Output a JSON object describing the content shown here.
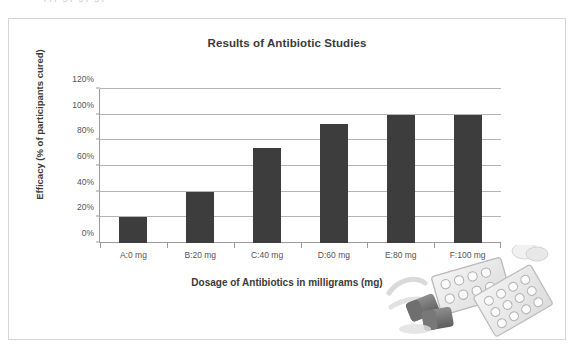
{
  "figure": {
    "top_crop_text": "ppp g p g p g p",
    "border_color": "#d6d6d6",
    "background": "#ffffff"
  },
  "chart_data": {
    "type": "bar",
    "title": "Results of Antibiotic Studies",
    "xlabel": "Dosage of Antibiotics in milligrams (mg)",
    "ylabel": "Efficacy (% of participants cured)",
    "categories": [
      "A:0 mg",
      "B:20 mg",
      "C:40 mg",
      "D:60 mg",
      "E:80 mg",
      "F:100 mg"
    ],
    "values": [
      20,
      40,
      74,
      93,
      100,
      100
    ],
    "value_labels": [
      "20%",
      "40%",
      "74%",
      "93%",
      "100%",
      "100%"
    ],
    "ylim": [
      0,
      120
    ],
    "ytick_values": [
      0,
      20,
      40,
      60,
      80,
      100,
      120
    ],
    "ytick_labels": [
      "0%",
      "20%",
      "40%",
      "60%",
      "80%",
      "100%",
      "120%"
    ],
    "grid": true,
    "grid_axis": "y",
    "legend": false,
    "bar_color": "#3d3d3d",
    "gridline_color": "#b5b5b5",
    "axis_color": "#9a9a9a",
    "text_color": "#3a3a3a",
    "tick_text_color": "#555555"
  },
  "decoration": {
    "photo_name": "pills-blister-pack-photo",
    "description": "grayscale photo of blister packs of tablets and capsules"
  }
}
